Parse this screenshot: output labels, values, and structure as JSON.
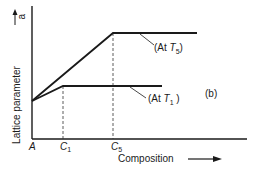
{
  "diagram": {
    "panel_label": "(b)",
    "y_axis": {
      "label": "Lattice parameter",
      "symbol": "a"
    },
    "x_axis": {
      "label": "Composition",
      "origin": "A",
      "ticks": [
        "C1",
        "C5"
      ]
    },
    "curves": [
      {
        "name": "At T5",
        "label": "(At T5)",
        "description": "rises linearly from A to C5 then flat"
      },
      {
        "name": "At T1",
        "label": "(At T1)",
        "description": "rises linearly from A to C1 then flat"
      }
    ]
  },
  "text": {
    "y_label": "Lattice parameter",
    "y_symbol": "a",
    "x_label": "Composition",
    "origin": "A",
    "c1_main": "C",
    "c1_sub": "1",
    "c5_main": "C",
    "c5_sub": "5",
    "t5_pre": "(At ",
    "t5_T": "T",
    "t5_sub": "5",
    "t5_post": ")",
    "t1_pre": "(At ",
    "t1_T": "T",
    "t1_sub": "1",
    "t1_post": " )",
    "panel": "(b)"
  }
}
